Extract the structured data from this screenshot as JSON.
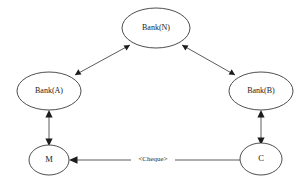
{
  "diagram": {
    "background_color": "#ffffff",
    "stroke_color": "#3a3a3a",
    "edge_color": "#4a4a4a",
    "arrow_color": "#1c1c1c",
    "text_color": "#222222",
    "nodes": [
      {
        "id": "bank_n",
        "label": "Bank(N)",
        "shape": "ellipse",
        "cx": 156,
        "cy": 28,
        "rx": 34,
        "ry": 20
      },
      {
        "id": "bank_a",
        "label": "Bank(A)",
        "shape": "ellipse",
        "cx": 49,
        "cy": 91,
        "rx": 32,
        "ry": 19
      },
      {
        "id": "bank_b",
        "label": "Bank(B)",
        "shape": "ellipse",
        "cx": 261,
        "cy": 91,
        "rx": 32,
        "ry": 19
      },
      {
        "id": "merchant",
        "label": "M",
        "shape": "ellipse",
        "cx": 49,
        "cy": 160,
        "rx": 20,
        "ry": 15
      },
      {
        "id": "customer",
        "label": "C",
        "shape": "ellipse",
        "cx": 261,
        "cy": 159,
        "rx": 21,
        "ry": 16
      }
    ],
    "edges": [
      {
        "id": "edge_a_n",
        "from": "bank_a",
        "to": "bank_n",
        "label": "",
        "direction": "both"
      },
      {
        "id": "edge_b_n",
        "from": "bank_b",
        "to": "bank_n",
        "label": "",
        "direction": "both"
      },
      {
        "id": "edge_m_a",
        "from": "merchant",
        "to": "bank_a",
        "label": "",
        "direction": "both"
      },
      {
        "id": "edge_c_b",
        "from": "customer",
        "to": "bank_b",
        "label": "",
        "direction": "both"
      },
      {
        "id": "edge_c_m",
        "from": "customer",
        "to": "merchant",
        "label": "<Cheque>",
        "direction": "to"
      }
    ]
  }
}
